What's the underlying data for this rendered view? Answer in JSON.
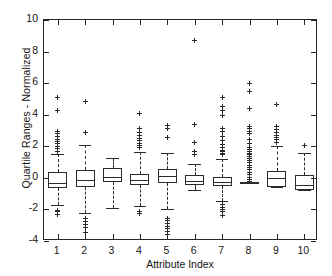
{
  "chart_data": {
    "type": "box",
    "title": "",
    "xlabel": "Attribute Index",
    "ylabel": "Quartile Ranges - Normalized",
    "xlim": [
      0.5,
      10.5
    ],
    "ylim": [
      -4,
      10
    ],
    "yticks": [
      -4,
      -2,
      0,
      2,
      4,
      6,
      8,
      10
    ],
    "ytick_labels": [
      "-4",
      "-2",
      "0",
      "2",
      "4",
      "6",
      "8",
      "10"
    ],
    "xticks": [
      1,
      2,
      3,
      4,
      5,
      6,
      7,
      8,
      9,
      10
    ],
    "xtick_labels": [
      "1",
      "2",
      "3",
      "4",
      "5",
      "6",
      "7",
      "8",
      "9",
      "10"
    ],
    "grid": false,
    "legend": null,
    "categories": [
      "1",
      "2",
      "3",
      "4",
      "5",
      "6",
      "7",
      "8",
      "9",
      "10"
    ],
    "boxes": [
      {
        "index": 1,
        "q1": -0.65,
        "median": -0.3,
        "q3": 0.35,
        "whisker_low": -1.75,
        "whisker_high": 1.5,
        "outliers": [
          5.1,
          4.25,
          2.95,
          2.8,
          2.6,
          2.45,
          2.3,
          2.15,
          2.0,
          1.85,
          1.7,
          -2.05,
          -2.15,
          -2.3
        ]
      },
      {
        "index": 2,
        "q1": -0.55,
        "median": -0.15,
        "q3": 0.5,
        "whisker_low": -2.25,
        "whisker_high": 2.1,
        "outliers": [
          4.85,
          2.85,
          -2.55,
          -2.75,
          -2.95,
          -3.15,
          -3.45
        ]
      },
      {
        "index": 3,
        "q1": -0.25,
        "median": 0.05,
        "q3": 0.6,
        "whisker_low": -1.9,
        "whisker_high": 1.25,
        "outliers": []
      },
      {
        "index": 4,
        "q1": -0.45,
        "median": -0.15,
        "q3": 0.25,
        "whisker_low": -1.8,
        "whisker_high": 1.65,
        "outliers": [
          4.1,
          3.1,
          2.9,
          2.7,
          2.5,
          2.35,
          2.2,
          2.05,
          1.9,
          -2.1,
          -2.25
        ]
      },
      {
        "index": 5,
        "q1": -0.35,
        "median": 0.1,
        "q3": 0.55,
        "whisker_low": -1.95,
        "whisker_high": 1.6,
        "outliers": [
          3.3,
          3.15,
          2.55,
          -2.55,
          -2.7,
          -2.9,
          -3.05,
          -3.2,
          -3.4,
          -3.6
        ]
      },
      {
        "index": 6,
        "q1": -0.45,
        "median": -0.2,
        "q3": 0.2,
        "whisker_low": -0.75,
        "whisker_high": 0.9,
        "outliers": [
          8.7,
          3.4,
          2.25,
          1.65,
          1.45
        ]
      },
      {
        "index": 7,
        "q1": -0.5,
        "median": -0.25,
        "q3": 0.05,
        "whisker_low": -1.45,
        "whisker_high": 1.2,
        "outliers": [
          5.1,
          4.55,
          4.25,
          3.95,
          3.15,
          2.95,
          2.6,
          2.35,
          2.1,
          1.9,
          1.75,
          1.65,
          1.55,
          1.45,
          -1.7,
          -1.85,
          -2.0,
          -2.15,
          -2.4
        ]
      },
      {
        "index": 8,
        "q1": -0.35,
        "median": -0.32,
        "q3": -0.28,
        "whisker_low": -0.35,
        "whisker_high": -0.28,
        "outliers": [
          6.0,
          5.5,
          4.4,
          3.25,
          3.1,
          2.95,
          2.8,
          2.45,
          2.15,
          1.95,
          1.8,
          1.65,
          1.55,
          1.45,
          1.35,
          1.25,
          1.1,
          0.95,
          0.8,
          0.65,
          0.5,
          0.35,
          0.2,
          0.05,
          -0.1,
          -0.25
        ]
      },
      {
        "index": 9,
        "q1": -0.55,
        "median": 0.0,
        "q3": 0.45,
        "whisker_low": -0.6,
        "whisker_high": 2.0,
        "outliers": [
          4.65,
          3.25,
          3.05,
          2.9,
          2.7,
          2.55,
          2.4,
          2.25
        ]
      },
      {
        "index": 10,
        "q1": -0.75,
        "median": -0.45,
        "q3": 0.15,
        "whisker_low": -0.8,
        "whisker_high": 1.6,
        "outliers": [
          2.05
        ]
      }
    ]
  }
}
